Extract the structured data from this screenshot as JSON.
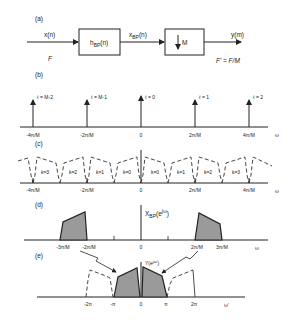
{
  "panels": {
    "a": {
      "label": "(a)",
      "input": "x(n)",
      "input_rate": "F",
      "filter_main": "h",
      "filter_sub": "BP",
      "filter_arg": "(n)",
      "mid_main": "x",
      "mid_sub": "BP",
      "mid_arg": "(n)",
      "decimator": "M",
      "output": "y(m)",
      "output_rate": "F' = F/M"
    },
    "b": {
      "label": "(b)",
      "impulse_labels": [
        "ℓ = M-2",
        "ℓ = M-1",
        "ℓ = 0",
        "ℓ = 1",
        "ℓ = 2"
      ],
      "ticks": [
        "-4π/M",
        "-2π/M",
        "0",
        "2π/M",
        "4π/M"
      ],
      "axis": "ω"
    },
    "c": {
      "label": "(c)",
      "bands": [
        "k=3",
        "k=2",
        "k=1",
        "k=0",
        "k=0",
        "k=1",
        "k=2",
        "k=3"
      ],
      "ticks": [
        "-4π/M",
        "-2π/M",
        "0",
        "2π/M",
        "4π/M"
      ],
      "axis": "ω"
    },
    "d": {
      "label": "(d)",
      "func_main": "X",
      "func_sub": "BP",
      "func_arg": "(e",
      "func_exp": "jω",
      "func_close": ")",
      "ticks": [
        "-3π/M",
        "-2π/M",
        "0",
        "2π/M",
        "3π/M"
      ],
      "axis": "ω"
    },
    "e": {
      "label": "(e)",
      "func": "Y(e",
      "func_exp": "jω'",
      "func_close": ")",
      "ticks": [
        "-2π",
        "-π",
        "0",
        "π",
        "2π"
      ],
      "axis": "ω'"
    }
  }
}
